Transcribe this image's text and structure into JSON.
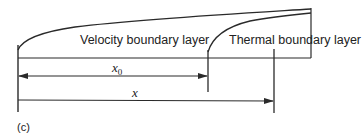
{
  "diagram": {
    "panel_label": "(c)",
    "regions": {
      "velocity_label": "Velocity boundary layer",
      "thermal_label": "Thermal boundary layer"
    },
    "dimensions": {
      "x0_label": "x",
      "x0_subscript": "0",
      "x_label": "x"
    },
    "colors": {
      "line": "#2a2a2a",
      "text": "#222222",
      "background": "#ffffff"
    }
  }
}
